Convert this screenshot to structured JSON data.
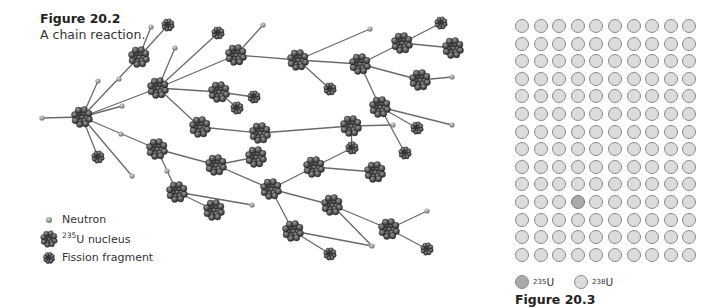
{
  "figure_left": {
    "title": "Figure 20.2",
    "caption": "A chain reaction.",
    "legend": [
      {
        "type": "neutron",
        "label": "Neutron",
        "sup": ""
      },
      {
        "type": "nucleus",
        "label": "U nucleus",
        "sup": "235"
      },
      {
        "type": "fragment",
        "label": "Fission fragment",
        "sup": ""
      }
    ],
    "nuclei": [
      [
        82,
        117
      ],
      [
        158,
        88
      ],
      [
        139,
        57
      ],
      [
        157,
        149
      ],
      [
        236,
        55
      ],
      [
        219,
        92
      ],
      [
        200,
        127
      ],
      [
        260,
        133
      ],
      [
        216,
        165
      ],
      [
        256,
        157
      ],
      [
        177,
        192
      ],
      [
        214,
        210
      ],
      [
        298,
        60
      ],
      [
        360,
        64
      ],
      [
        402,
        43
      ],
      [
        453,
        48
      ],
      [
        420,
        80
      ],
      [
        380,
        107
      ],
      [
        351,
        126
      ],
      [
        271,
        189
      ],
      [
        314,
        167
      ],
      [
        375,
        172
      ],
      [
        332,
        205
      ],
      [
        293,
        231
      ],
      [
        389,
        229
      ]
    ],
    "fragments": [
      [
        98,
        157
      ],
      [
        168,
        25
      ],
      [
        218,
        33
      ],
      [
        254,
        97
      ],
      [
        237,
        108
      ],
      [
        330,
        89
      ],
      [
        441,
        23
      ],
      [
        417,
        128
      ],
      [
        352,
        148
      ],
      [
        405,
        153
      ],
      [
        330,
        254
      ],
      [
        427,
        249
      ]
    ],
    "neutrons": [
      [
        42,
        118
      ],
      [
        98,
        81
      ],
      [
        119,
        79
      ],
      [
        122,
        106
      ],
      [
        132,
        176
      ],
      [
        121,
        134
      ],
      [
        167,
        171
      ],
      [
        151,
        27
      ],
      [
        175,
        48
      ],
      [
        263,
        25
      ],
      [
        370,
        29
      ],
      [
        452,
        77
      ],
      [
        452,
        125
      ],
      [
        393,
        125
      ],
      [
        252,
        205
      ],
      [
        372,
        246
      ],
      [
        427,
        211
      ]
    ],
    "edges": [
      [
        42,
        118,
        82,
        117
      ],
      [
        82,
        117,
        98,
        81
      ],
      [
        82,
        117,
        122,
        106
      ],
      [
        82,
        117,
        139,
        57
      ],
      [
        82,
        117,
        158,
        88
      ],
      [
        82,
        117,
        98,
        157
      ],
      [
        82,
        117,
        132,
        176
      ],
      [
        82,
        117,
        157,
        149
      ],
      [
        139,
        57,
        151,
        27
      ],
      [
        139,
        57,
        168,
        25
      ],
      [
        158,
        88,
        175,
        48
      ],
      [
        158,
        88,
        218,
        33
      ],
      [
        158,
        88,
        236,
        55
      ],
      [
        158,
        88,
        219,
        92
      ],
      [
        158,
        88,
        200,
        127
      ],
      [
        236,
        55,
        263,
        25
      ],
      [
        236,
        55,
        298,
        60
      ],
      [
        219,
        92,
        254,
        97
      ],
      [
        219,
        92,
        237,
        108
      ],
      [
        298,
        60,
        370,
        29
      ],
      [
        298,
        60,
        330,
        89
      ],
      [
        298,
        60,
        360,
        64
      ],
      [
        360,
        64,
        402,
        43
      ],
      [
        402,
        43,
        441,
        23
      ],
      [
        402,
        43,
        453,
        48
      ],
      [
        360,
        64,
        420,
        80
      ],
      [
        420,
        80,
        452,
        77
      ],
      [
        360,
        64,
        380,
        107
      ],
      [
        380,
        107,
        417,
        128
      ],
      [
        380,
        107,
        452,
        125
      ],
      [
        380,
        107,
        405,
        153
      ],
      [
        200,
        127,
        260,
        133
      ],
      [
        260,
        133,
        351,
        126
      ],
      [
        351,
        126,
        393,
        125
      ],
      [
        351,
        126,
        352,
        148
      ],
      [
        157,
        149,
        216,
        165
      ],
      [
        216,
        165,
        256,
        157
      ],
      [
        216,
        165,
        271,
        189
      ],
      [
        157,
        149,
        177,
        192
      ],
      [
        177,
        192,
        214,
        210
      ],
      [
        177,
        192,
        252,
        205
      ],
      [
        271,
        189,
        314,
        167
      ],
      [
        314,
        167,
        375,
        172
      ],
      [
        314,
        167,
        352,
        148
      ],
      [
        271,
        189,
        332,
        205
      ],
      [
        332,
        205,
        389,
        229
      ],
      [
        389,
        229,
        427,
        211
      ],
      [
        389,
        229,
        427,
        249
      ],
      [
        332,
        205,
        372,
        246
      ],
      [
        271,
        189,
        293,
        231
      ],
      [
        293,
        231,
        372,
        246
      ],
      [
        293,
        231,
        330,
        254
      ]
    ]
  },
  "figure_right": {
    "title": "Figure 20.3",
    "grid": {
      "rows": 14,
      "cols": 10,
      "u235_cells": [
        [
          10,
          3
        ]
      ]
    },
    "legend": [
      {
        "type": "u235",
        "sup": "235",
        "label": "U"
      },
      {
        "type": "u238",
        "sup": "238",
        "label": "U"
      }
    ]
  }
}
